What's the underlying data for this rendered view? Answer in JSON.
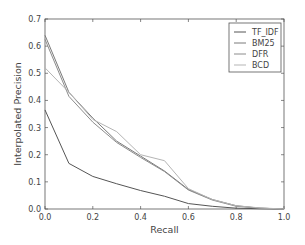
{
  "chart_data": {
    "type": "line",
    "title": "",
    "xlabel": "Recall",
    "ylabel": "Interpolated Precision",
    "xlim": [
      0.0,
      1.0
    ],
    "ylim": [
      0.0,
      0.7
    ],
    "xticks": [
      "0.0",
      "0.2",
      "0.4",
      "0.6",
      "0.8",
      "1.0"
    ],
    "yticks": [
      "0.0",
      "0.1",
      "0.2",
      "0.3",
      "0.4",
      "0.5",
      "0.6",
      "0.7"
    ],
    "grid": false,
    "legend_position": "upper right",
    "x": [
      0.0,
      0.1,
      0.2,
      0.3,
      0.4,
      0.5,
      0.6,
      0.7,
      0.8,
      0.9,
      1.0
    ],
    "series": [
      {
        "name": "TF_IDF",
        "color": "#555555",
        "values": [
          0.365,
          0.168,
          0.12,
          0.093,
          0.068,
          0.047,
          0.02,
          0.01,
          0.003,
          0.001,
          0.0
        ]
      },
      {
        "name": "BM25",
        "color": "#7a7a7a",
        "values": [
          0.64,
          0.43,
          0.335,
          0.25,
          0.195,
          0.14,
          0.072,
          0.035,
          0.012,
          0.003,
          0.0
        ]
      },
      {
        "name": "DFR",
        "color": "#8c8c8c",
        "values": [
          0.625,
          0.415,
          0.32,
          0.245,
          0.19,
          0.138,
          0.07,
          0.033,
          0.01,
          0.003,
          0.0
        ]
      },
      {
        "name": "BCD",
        "color": "#b5b5b5",
        "values": [
          0.52,
          0.43,
          0.33,
          0.285,
          0.2,
          0.178,
          0.075,
          0.035,
          0.012,
          0.004,
          0.0
        ]
      }
    ]
  },
  "legend": {
    "items": [
      "TF_IDF",
      "BM25",
      "DFR",
      "BCD"
    ]
  }
}
